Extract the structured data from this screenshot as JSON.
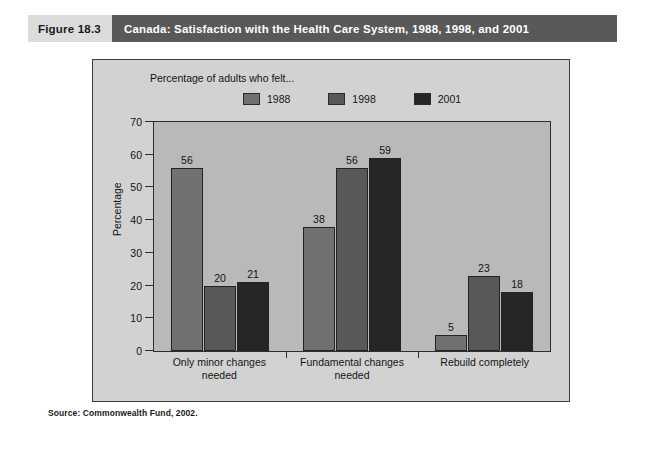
{
  "figure": {
    "number": "Figure 18.3",
    "title": "Canada: Satisfaction with the Health Care System, 1988, 1998, and 2001"
  },
  "source": {
    "text": "Source: Commonwealth Fund, 2002."
  },
  "colors": {
    "header_number_bg": "#dcdcdc",
    "header_title_bg": "#595959",
    "panel_bg": "#d2d2d2",
    "plot_bg": "#b9b9b9",
    "series_1988": "#717171",
    "series_1998": "#585858",
    "series_2001": "#262626"
  },
  "chart_data": {
    "type": "bar",
    "title": "Canada: Satisfaction with the Health Care System, 1988, 1998, and 2001",
    "subtitle": "Percentage of adults who felt...",
    "xlabel": "",
    "ylabel": "Percentage",
    "ylim": [
      0,
      70
    ],
    "yticks": [
      0,
      10,
      20,
      30,
      40,
      50,
      60,
      70
    ],
    "grid": false,
    "legend_position": "top-right",
    "categories": [
      "Only minor changes needed",
      "Fundamental changes needed",
      "Rebuild completely"
    ],
    "category_lines": [
      [
        "Only minor changes",
        "needed"
      ],
      [
        "Fundamental changes",
        "needed"
      ],
      [
        "Rebuild completely"
      ]
    ],
    "series": [
      {
        "name": "1988",
        "color": "#717171",
        "values": [
          56,
          38,
          5
        ]
      },
      {
        "name": "1998",
        "color": "#585858",
        "values": [
          20,
          56,
          23
        ]
      },
      {
        "name": "2001",
        "color": "#262626",
        "values": [
          21,
          59,
          18
        ]
      }
    ]
  }
}
